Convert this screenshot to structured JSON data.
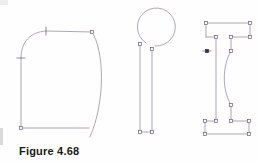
{
  "page": {
    "width": 258,
    "height": 163,
    "background_color": "#fefefe",
    "caption": "Figure 4.68"
  },
  "style": {
    "line_color": "#9c8ea6",
    "line_color_dark": "#7d6d88",
    "node_fill_color": "#ffffff",
    "node_stroke_color": "#6b5c78",
    "node_selected_fill": "#3a2f44",
    "caption_color": "#1a1a1a",
    "line_width": 0.8
  },
  "figures": [
    {
      "id": "figure-left",
      "name": "rounded-profile-shape",
      "description": "Closed profile with rounded top-left fillet, straight top edge, convex right side curve, straight bottom edge and straight left side",
      "segments": [
        {
          "type": "line",
          "name": "left-vertical-edge",
          "x1": 21,
          "y1": 58,
          "x2": 21,
          "y2": 128
        },
        {
          "type": "line",
          "name": "bottom-horizontal-edge",
          "x1": 21,
          "y1": 128,
          "x2": 89,
          "y2": 128
        },
        {
          "type": "arc",
          "name": "top-left-fillet",
          "path": "M 21 58 C 21 42 30 32 46 31"
        },
        {
          "type": "line",
          "name": "top-horizontal-edge",
          "x1": 46,
          "y1": 31,
          "x2": 92,
          "y2": 32
        },
        {
          "type": "curve",
          "name": "right-convex-curve",
          "path": "M 92 32 C 104 50 106 100 90 137"
        }
      ],
      "nodes": [
        {
          "name": "node-bottom-left",
          "x": 21,
          "y": 128,
          "style": "square-open"
        },
        {
          "name": "node-top-right",
          "x": 92,
          "y": 32,
          "style": "square-open"
        }
      ],
      "ticks": [
        {
          "name": "tick-top-tangent",
          "x": 46,
          "y": 31,
          "orientation": "vertical",
          "length": 9
        },
        {
          "name": "tick-left-tangent",
          "x": 21,
          "y": 58,
          "orientation": "horizontal",
          "length": 9
        }
      ]
    },
    {
      "id": "figure-middle",
      "name": "balloon-with-stem-shape",
      "description": "Open circle at top with a gap, and two parallel vertical stem lines descending from the circle to square end nodes",
      "segments": [
        {
          "type": "arc",
          "name": "circle-outline",
          "path": "M 146 43 A 19 19 0 1 1 155 46"
        },
        {
          "type": "line",
          "name": "stem-left-line",
          "x1": 140,
          "y1": 44,
          "x2": 140,
          "y2": 132
        },
        {
          "type": "line",
          "name": "stem-right-line",
          "x1": 152,
          "y1": 49,
          "x2": 152,
          "y2": 132
        },
        {
          "type": "line",
          "name": "stem-bottom-cap",
          "x1": 140,
          "y1": 132,
          "x2": 152,
          "y2": 132
        }
      ],
      "nodes": [
        {
          "name": "node-stem-left-top",
          "x": 140,
          "y": 44,
          "style": "square-open"
        },
        {
          "name": "node-stem-right-top",
          "x": 152,
          "y": 49,
          "style": "square-open"
        },
        {
          "name": "node-stem-left-bottom",
          "x": 140,
          "y": 132,
          "style": "square-open"
        },
        {
          "name": "node-stem-right-bottom",
          "x": 152,
          "y": 132,
          "style": "square-open"
        }
      ],
      "ticks": []
    },
    {
      "id": "figure-right",
      "name": "i-beam-section-shape",
      "description": "Capital I / I-beam cross-section outline with stepped flanges, square node markers at every vertex and a concave arc on the inner right web",
      "segments": [
        {
          "type": "line",
          "name": "top-flange-top-edge",
          "x1": 206,
          "y1": 23,
          "x2": 250,
          "y2": 23
        },
        {
          "type": "line",
          "name": "top-flange-right-drop",
          "x1": 250,
          "y1": 23,
          "x2": 250,
          "y2": 37
        },
        {
          "type": "line",
          "name": "top-flange-right-under",
          "x1": 250,
          "y1": 37,
          "x2": 231,
          "y2": 37
        },
        {
          "type": "line",
          "name": "web-right-upper",
          "x1": 231,
          "y1": 37,
          "x2": 231,
          "y2": 51
        },
        {
          "type": "curve",
          "name": "web-right-concave-arc",
          "path": "M 231 51 C 222 66 222 90 231 105"
        },
        {
          "type": "line",
          "name": "web-right-lower",
          "x1": 231,
          "y1": 105,
          "x2": 231,
          "y2": 121
        },
        {
          "type": "line",
          "name": "bottom-flange-right-over",
          "x1": 231,
          "y1": 121,
          "x2": 249,
          "y2": 121
        },
        {
          "type": "line",
          "name": "bottom-flange-right-drop",
          "x1": 249,
          "y1": 121,
          "x2": 249,
          "y2": 134
        },
        {
          "type": "line",
          "name": "bottom-flange-bottom-edge",
          "x1": 249,
          "y1": 134,
          "x2": 205,
          "y2": 134
        },
        {
          "type": "line",
          "name": "bottom-flange-left-rise",
          "x1": 205,
          "y1": 134,
          "x2": 205,
          "y2": 121
        },
        {
          "type": "line",
          "name": "bottom-flange-left-over",
          "x1": 205,
          "y1": 121,
          "x2": 216,
          "y2": 121
        },
        {
          "type": "line",
          "name": "web-left-edge",
          "x1": 216,
          "y1": 121,
          "x2": 216,
          "y2": 37
        },
        {
          "type": "line",
          "name": "top-flange-left-under",
          "x1": 216,
          "y1": 37,
          "x2": 206,
          "y2": 37
        },
        {
          "type": "line",
          "name": "top-flange-left-rise",
          "x1": 206,
          "y1": 37,
          "x2": 206,
          "y2": 23
        }
      ],
      "nodes": [
        {
          "name": "node-top-left-outer",
          "x": 206,
          "y": 23,
          "style": "square-open"
        },
        {
          "name": "node-top-right-outer",
          "x": 250,
          "y": 23,
          "style": "square-open"
        },
        {
          "name": "node-top-right-inner",
          "x": 250,
          "y": 37,
          "style": "square-open"
        },
        {
          "name": "node-top-flange-right-step",
          "x": 231,
          "y": 37,
          "style": "square-open"
        },
        {
          "name": "node-web-right-arc-top",
          "x": 231,
          "y": 51,
          "style": "square-open"
        },
        {
          "name": "node-web-right-arc-bottom",
          "x": 231,
          "y": 105,
          "style": "square-open"
        },
        {
          "name": "node-bottom-flange-right-step",
          "x": 231,
          "y": 121,
          "style": "square-open"
        },
        {
          "name": "node-bottom-right-inner",
          "x": 249,
          "y": 121,
          "style": "square-open"
        },
        {
          "name": "node-bottom-right-outer",
          "x": 249,
          "y": 134,
          "style": "square-open"
        },
        {
          "name": "node-bottom-left-outer",
          "x": 205,
          "y": 134,
          "style": "square-open"
        },
        {
          "name": "node-bottom-left-inner",
          "x": 205,
          "y": 121,
          "style": "square-open"
        },
        {
          "name": "node-bottom-flange-left-step",
          "x": 216,
          "y": 121,
          "style": "square-open"
        },
        {
          "name": "node-top-flange-left-step",
          "x": 216,
          "y": 37,
          "style": "square-open"
        },
        {
          "name": "node-web-left-selected",
          "x": 207,
          "y": 51,
          "style": "square-filled"
        }
      ],
      "ticks": [
        {
          "name": "tick-web-left-selected",
          "x": 207,
          "y": 51,
          "orientation": "horizontal",
          "length": 9
        }
      ]
    }
  ]
}
